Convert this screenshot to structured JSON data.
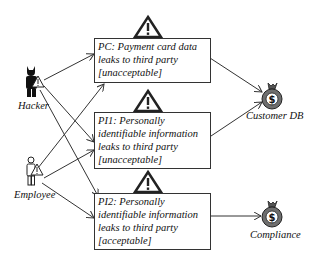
{
  "actors": [
    {
      "id": "hacker",
      "label": "Hacker"
    },
    {
      "id": "employee",
      "label": "Employee"
    }
  ],
  "risks": [
    {
      "id": "PC",
      "lines": [
        "PC: Payment card data",
        "leaks to third party",
        "[unacceptable]"
      ],
      "rating": "unacceptable"
    },
    {
      "id": "PI1",
      "lines": [
        "PI1: Personally",
        "identifiable information",
        "leaks to third party",
        "[unacceptable]"
      ],
      "rating": "unacceptable"
    },
    {
      "id": "PI2",
      "lines": [
        "PI2: Personally",
        "identifiable information",
        "leaks to third party",
        "[acceptable]"
      ],
      "rating": "acceptable"
    }
  ],
  "assets": [
    {
      "id": "customer_db",
      "label": "Customer DB",
      "icon": "money-bag-icon"
    },
    {
      "id": "compliance",
      "label": "Compliance",
      "icon": "money-bag-icon"
    }
  ],
  "edges": [
    {
      "from": "hacker",
      "to": "PC"
    },
    {
      "from": "hacker",
      "to": "PI1"
    },
    {
      "from": "hacker",
      "to": "PI2"
    },
    {
      "from": "employee",
      "to": "PC"
    },
    {
      "from": "employee",
      "to": "PI1"
    },
    {
      "from": "employee",
      "to": "PI2"
    },
    {
      "from": "PC",
      "to": "customer_db"
    },
    {
      "from": "PI1",
      "to": "customer_db"
    },
    {
      "from": "PI2",
      "to": "compliance"
    }
  ],
  "colors": {
    "line": "#333333",
    "money_bag": "#6e6e6e",
    "warning_fill": "#ffffff",
    "warning_stroke": "#222222"
  }
}
